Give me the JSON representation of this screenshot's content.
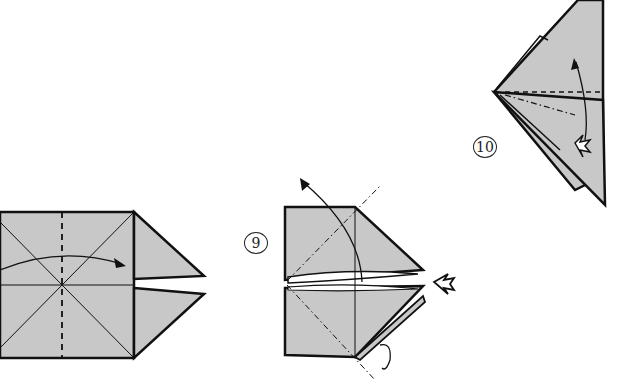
{
  "diagram": {
    "type": "origami-instructions",
    "colors": {
      "paper": "#c8c8c8",
      "line": "#111111",
      "background": "#ffffff"
    },
    "steps": [
      {
        "id": "step-8",
        "label": "",
        "description": "Square base with diagonal creases, valley fold along center dashed line, arrow folding right half"
      },
      {
        "id": "step-9",
        "label": "9",
        "description": "Squash open along diagonal dash-dot lines; push arrow from right; turn-over arrow at bottom"
      },
      {
        "id": "step-10",
        "label": "10",
        "description": "Triangular form with dashed fold lines; arrow lifting flap up; push arrow at lower right"
      }
    ]
  }
}
